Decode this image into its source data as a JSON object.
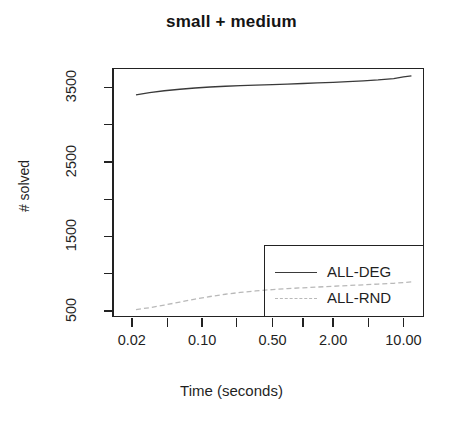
{
  "chart_data": {
    "type": "line",
    "title": "small + medium",
    "xlabel": "Time (seconds)",
    "ylabel": "# solved",
    "xscale": "log",
    "xlim": [
      0.013,
      16.0
    ],
    "ylim": [
      420,
      3760
    ],
    "grid": false,
    "legend_position": "bottom-right",
    "xticks": [
      {
        "value": 0.02,
        "label": "0.02",
        "major": true
      },
      {
        "value": 0.045,
        "label": "",
        "major": false
      },
      {
        "value": 0.1,
        "label": "0.10",
        "major": true
      },
      {
        "value": 0.22,
        "label": "",
        "major": false
      },
      {
        "value": 0.5,
        "label": "0.50",
        "major": true
      },
      {
        "value": 1.0,
        "label": "",
        "major": false
      },
      {
        "value": 2.0,
        "label": "2.00",
        "major": true
      },
      {
        "value": 4.5,
        "label": "",
        "major": false
      },
      {
        "value": 10.0,
        "label": "10.00",
        "major": true
      }
    ],
    "yticks": [
      {
        "value": 500,
        "label": "500",
        "major": true
      },
      {
        "value": 1000,
        "label": "",
        "major": false
      },
      {
        "value": 1500,
        "label": "1500",
        "major": true
      },
      {
        "value": 2000,
        "label": "",
        "major": false
      },
      {
        "value": 2500,
        "label": "2500",
        "major": true
      },
      {
        "value": 3000,
        "label": "",
        "major": false
      },
      {
        "value": 3500,
        "label": "3500",
        "major": true
      }
    ],
    "series": [
      {
        "name": "ALL-DEG",
        "style": "solid",
        "color": "#3a3a3a",
        "x": [
          0.022,
          0.03,
          0.042,
          0.06,
          0.085,
          0.12,
          0.17,
          0.24,
          0.34,
          0.5,
          0.7,
          1.0,
          1.4,
          2.0,
          2.8,
          4.0,
          5.6,
          8.0,
          10.0,
          12.0
        ],
        "y": [
          3400,
          3430,
          3455,
          3475,
          3492,
          3505,
          3515,
          3523,
          3530,
          3538,
          3545,
          3552,
          3560,
          3568,
          3578,
          3588,
          3600,
          3618,
          3640,
          3655
        ]
      },
      {
        "name": "ALL-RND",
        "style": "dashed",
        "color": "#b9b9b9",
        "x": [
          0.022,
          0.03,
          0.042,
          0.06,
          0.085,
          0.12,
          0.17,
          0.24,
          0.34,
          0.5,
          0.7,
          1.0,
          1.4,
          2.0,
          2.8,
          4.0,
          5.6,
          8.0,
          10.0,
          12.0
        ],
        "y": [
          520,
          545,
          580,
          620,
          660,
          695,
          725,
          750,
          770,
          788,
          800,
          812,
          822,
          832,
          842,
          852,
          862,
          872,
          882,
          890
        ]
      }
    ]
  },
  "legend": {
    "entries": [
      {
        "label": "ALL-DEG"
      },
      {
        "label": "ALL-RND"
      }
    ]
  }
}
